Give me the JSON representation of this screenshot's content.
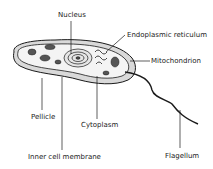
{
  "diagram": {
    "labels": {
      "nucleus": "Nucleus",
      "endoplasmic_reticulum": "Endoplasmic reticulum",
      "mitochondrion": "Mitochondrion",
      "pellicle": "Pellicle",
      "cytoplasm": "Cytoplasm",
      "inner_cell_membrane": "Inner cell membrane",
      "flagellum": "Flagellum"
    },
    "colors": {
      "line": "#1a1a1a",
      "cell_fill": "#f2f2f2",
      "pellicle_fill": "#d9d9d9",
      "organelle_fill": "#555555"
    }
  }
}
